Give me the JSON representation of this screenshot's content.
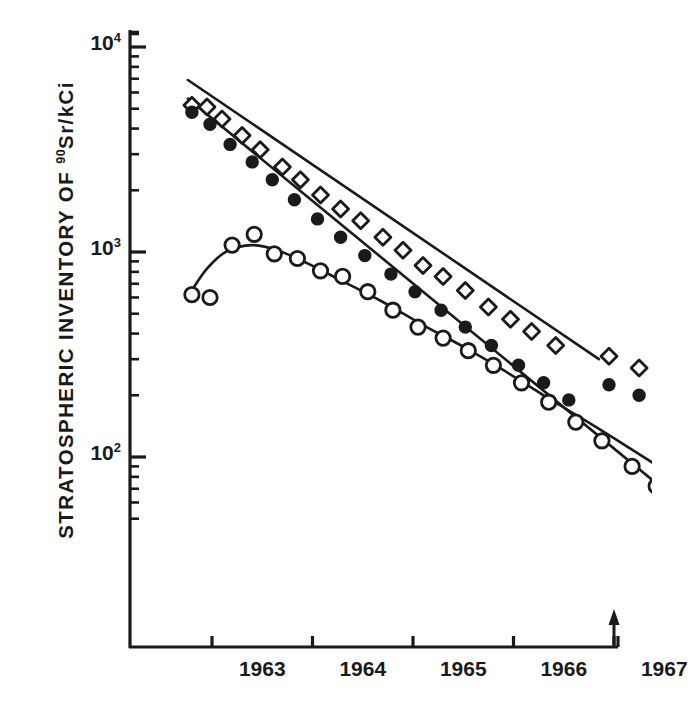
{
  "chart_data": {
    "type": "scatter",
    "title": "",
    "ylabel": "STRATOSPHERIC INVENTORY OF 90Sr/kCi",
    "ylabel_main": "STRATOSPHERIC INVENTORY OF ",
    "ylabel_sup": "90",
    "ylabel_tail": "Sr/kCi",
    "xlabel": "",
    "yscale": "log",
    "ylim": [
      40,
      14000
    ],
    "xlim": [
      1962.75,
      1967.75
    ],
    "grid": false,
    "legend": "none",
    "y_major_ticks": [
      {
        "value": 10000,
        "mantissa": "10",
        "exponent": "4"
      },
      {
        "value": 1000,
        "mantissa": "10",
        "exponent": "3"
      },
      {
        "value": 100,
        "mantissa": "10",
        "exponent": "2"
      }
    ],
    "y_minor_ticks": [
      9000,
      8000,
      7000,
      6000,
      5000,
      4000,
      3000,
      2000,
      900,
      800,
      700,
      600,
      500,
      400,
      300,
      200,
      90,
      80,
      70,
      60,
      50
    ],
    "x_tick_years": [
      1963,
      1964,
      1965,
      1966,
      1967
    ],
    "x_tick_labels": [
      "1963",
      "1964",
      "1965",
      "1966",
      "1967"
    ],
    "annotations": [
      {
        "name": "arrow-marker",
        "symbol": "up-arrow",
        "x": 1967.0,
        "note": "arrow on x-axis at 1967"
      }
    ],
    "series": [
      {
        "name": "open-diamond-series",
        "marker": "open-diamond",
        "color": "#1a1a1a",
        "points": [
          {
            "x": 1962.8,
            "y": 5200
          },
          {
            "x": 1962.95,
            "y": 5100
          },
          {
            "x": 1963.1,
            "y": 4450
          },
          {
            "x": 1963.3,
            "y": 3700
          },
          {
            "x": 1963.48,
            "y": 3150
          },
          {
            "x": 1963.7,
            "y": 2600
          },
          {
            "x": 1963.88,
            "y": 2250
          },
          {
            "x": 1964.08,
            "y": 1900
          },
          {
            "x": 1964.28,
            "y": 1620
          },
          {
            "x": 1964.48,
            "y": 1420
          },
          {
            "x": 1964.7,
            "y": 1180
          },
          {
            "x": 1964.9,
            "y": 1020
          },
          {
            "x": 1965.1,
            "y": 860
          },
          {
            "x": 1965.3,
            "y": 760
          },
          {
            "x": 1965.52,
            "y": 650
          },
          {
            "x": 1965.75,
            "y": 540
          },
          {
            "x": 1965.97,
            "y": 470
          },
          {
            "x": 1966.18,
            "y": 410
          },
          {
            "x": 1966.42,
            "y": 350
          },
          {
            "x": 1966.95,
            "y": 310
          },
          {
            "x": 1967.25,
            "y": 272
          },
          {
            "x": 1967.5,
            "y": 255
          }
        ]
      },
      {
        "name": "filled-circle-series",
        "marker": "filled-circle",
        "color": "#1a1a1a",
        "points": [
          {
            "x": 1962.8,
            "y": 4800
          },
          {
            "x": 1962.98,
            "y": 4200
          },
          {
            "x": 1963.18,
            "y": 3350
          },
          {
            "x": 1963.4,
            "y": 2750
          },
          {
            "x": 1963.6,
            "y": 2250
          },
          {
            "x": 1963.82,
            "y": 1800
          },
          {
            "x": 1964.05,
            "y": 1450
          },
          {
            "x": 1964.28,
            "y": 1180
          },
          {
            "x": 1964.52,
            "y": 960
          },
          {
            "x": 1964.78,
            "y": 780
          },
          {
            "x": 1965.02,
            "y": 640
          },
          {
            "x": 1965.28,
            "y": 520
          },
          {
            "x": 1965.52,
            "y": 430
          },
          {
            "x": 1965.78,
            "y": 350
          },
          {
            "x": 1966.05,
            "y": 280
          },
          {
            "x": 1966.3,
            "y": 230
          },
          {
            "x": 1966.55,
            "y": 190
          },
          {
            "x": 1966.95,
            "y": 225
          },
          {
            "x": 1967.25,
            "y": 200
          },
          {
            "x": 1967.5,
            "y": 200
          }
        ]
      },
      {
        "name": "open-circle-series",
        "marker": "open-circle",
        "color": "#1a1a1a",
        "points": [
          {
            "x": 1962.8,
            "y": 620
          },
          {
            "x": 1962.98,
            "y": 600
          },
          {
            "x": 1963.2,
            "y": 1080
          },
          {
            "x": 1963.42,
            "y": 1220
          },
          {
            "x": 1963.62,
            "y": 980
          },
          {
            "x": 1963.85,
            "y": 930
          },
          {
            "x": 1964.08,
            "y": 810
          },
          {
            "x": 1964.3,
            "y": 760
          },
          {
            "x": 1964.55,
            "y": 640
          },
          {
            "x": 1964.8,
            "y": 520
          },
          {
            "x": 1965.05,
            "y": 430
          },
          {
            "x": 1965.3,
            "y": 380
          },
          {
            "x": 1965.55,
            "y": 330
          },
          {
            "x": 1965.8,
            "y": 280
          },
          {
            "x": 1966.08,
            "y": 230
          },
          {
            "x": 1966.35,
            "y": 185
          },
          {
            "x": 1966.62,
            "y": 148
          },
          {
            "x": 1966.88,
            "y": 120
          },
          {
            "x": 1967.18,
            "y": 90
          },
          {
            "x": 1967.42,
            "y": 72
          },
          {
            "x": 1967.6,
            "y": 62
          }
        ]
      }
    ],
    "fit_curves": [
      {
        "name": "diamond-fit-line",
        "for_series": "open-diamond-series",
        "type": "exponential-decay-line",
        "points": [
          {
            "x": 1962.76,
            "y": 6900
          },
          {
            "x": 1966.85,
            "y": 300
          }
        ]
      },
      {
        "name": "filled-circle-fit-line",
        "for_series": "filled-circle-series",
        "type": "exponential-decay-line",
        "points": [
          {
            "x": 1962.76,
            "y": 5600
          },
          {
            "x": 1967.6,
            "y": 63
          }
        ]
      },
      {
        "name": "open-circle-fit-curve",
        "for_series": "open-circle-series",
        "type": "rise-then-decay-curve",
        "points": [
          {
            "x": 1962.79,
            "y": 640
          },
          {
            "x": 1962.95,
            "y": 830
          },
          {
            "x": 1963.15,
            "y": 1010
          },
          {
            "x": 1963.4,
            "y": 1080
          },
          {
            "x": 1963.65,
            "y": 1020
          },
          {
            "x": 1963.95,
            "y": 880
          },
          {
            "x": 1964.3,
            "y": 720
          },
          {
            "x": 1964.7,
            "y": 570
          },
          {
            "x": 1965.1,
            "y": 440
          },
          {
            "x": 1965.5,
            "y": 345
          },
          {
            "x": 1965.9,
            "y": 265
          },
          {
            "x": 1966.3,
            "y": 200
          },
          {
            "x": 1966.7,
            "y": 152
          },
          {
            "x": 1967.1,
            "y": 115
          },
          {
            "x": 1967.5,
            "y": 86
          },
          {
            "x": 1967.72,
            "y": 72
          }
        ]
      }
    ]
  }
}
